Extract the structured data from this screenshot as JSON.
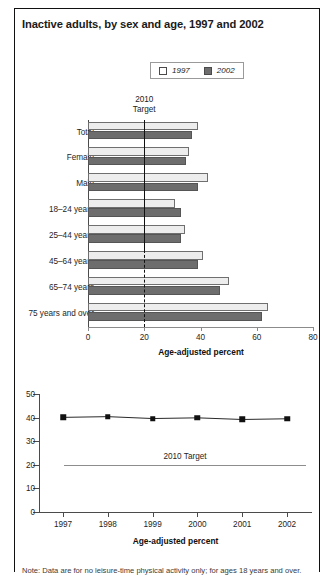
{
  "figure": {
    "title": "Inactive adults, by sex and age, 1997 and 2002",
    "note": "Note: Data are for no leisure-time physical activity only; for ages 18 years and over."
  },
  "legend": {
    "items": [
      {
        "label": "1997",
        "color": "#ffffff",
        "icon": "legend-swatch-1997"
      },
      {
        "label": "2002",
        "color": "#6d6d6d",
        "icon": "legend-swatch-2002"
      }
    ]
  },
  "chart_data": [
    {
      "type": "bar",
      "orientation": "horizontal",
      "title": "Inactive adults, by sex and age, 1997 and 2002",
      "xlabel": "Age-adjusted percent",
      "ylabel": "",
      "xlim": [
        0,
        80
      ],
      "xticks": [
        0,
        20,
        40,
        60,
        80
      ],
      "grid": false,
      "legend_position": "top-center",
      "categories": [
        "Total",
        "Female",
        "Male",
        "18–24 years",
        "25–44 years",
        "45–64 years",
        "65–74 years",
        "75 years and over"
      ],
      "series": [
        {
          "name": "1997",
          "values": [
            39.0,
            36.0,
            42.7,
            31.0,
            34.5,
            41.0,
            50.0,
            64.0
          ]
        },
        {
          "name": "2002",
          "values": [
            37.0,
            35.0,
            39.0,
            33.0,
            33.0,
            39.0,
            47.0,
            62.0
          ]
        }
      ],
      "annotations": [
        {
          "name": "target-line",
          "label": "2010\nTarget",
          "value": 20,
          "style": "solid-upper-dashed-lower"
        }
      ]
    },
    {
      "type": "line",
      "title": "",
      "xlabel": "Age-adjusted percent",
      "ylabel": "",
      "ylim": [
        0,
        50
      ],
      "yticks": [
        0,
        10,
        20,
        30,
        40,
        50
      ],
      "x": [
        "1997",
        "1998",
        "1999",
        "2000",
        "2001",
        "2002"
      ],
      "grid": false,
      "series": [
        {
          "name": "Inactive adults",
          "values": [
            40.1,
            40.4,
            39.6,
            39.9,
            39.2,
            39.5
          ],
          "marker": "square",
          "color": "#111111"
        }
      ],
      "annotations": [
        {
          "name": "target-line",
          "label": "2010 Target",
          "value": 20
        }
      ]
    }
  ],
  "target_caption": {
    "line1": "2010",
    "line2": "Target"
  },
  "target_caption_bottom": "2010 Target"
}
